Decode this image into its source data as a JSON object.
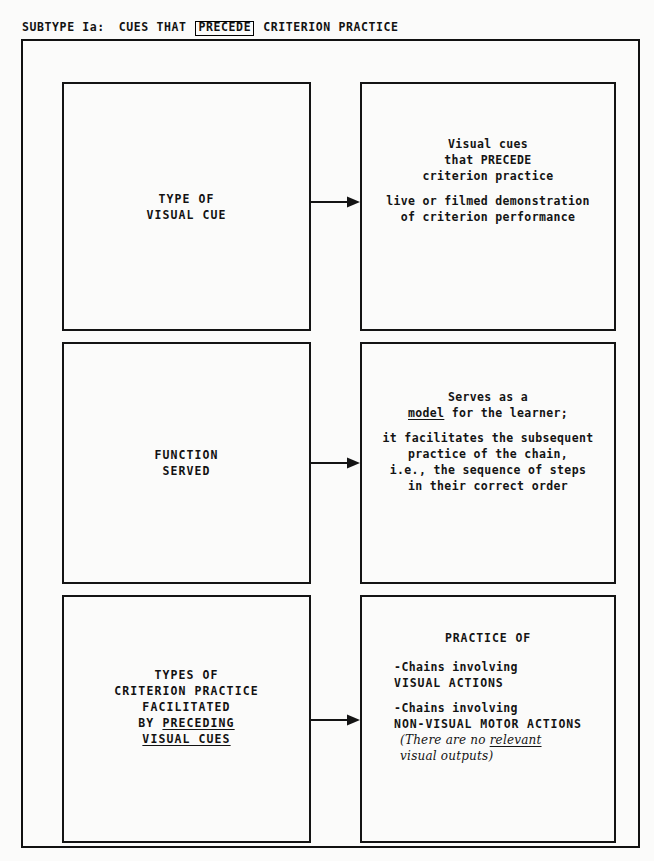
{
  "header": {
    "prefix": "SUBTYPE Ia:",
    "part1": "CUES THAT",
    "boxed_word": "PRECEDE",
    "part2": "CRITERION PRACTICE"
  },
  "rows": [
    {
      "id": "row-1",
      "left": {
        "lines": [
          "TYPE OF",
          "VISUAL CUE"
        ]
      },
      "right": {
        "group1": [
          "Visual cues",
          "that PRECEDE",
          "criterion practice"
        ],
        "group2": [
          "live or filmed demonstration",
          "of criterion performance"
        ]
      },
      "arrow": "arrow-type-of-visual-cue"
    },
    {
      "id": "row-2",
      "left": {
        "lines": [
          "FUNCTION",
          "SERVED"
        ]
      },
      "right": {
        "group1_a": "Serves as a",
        "group1_b_underlined": "model",
        "group1_b_rest": " for the learner;",
        "group2": [
          "it facilitates the subsequent",
          "practice of the chain,",
          "i.e., the sequence of steps",
          "in their correct order"
        ]
      },
      "arrow": "arrow-function-served"
    },
    {
      "id": "row-3",
      "left": {
        "lines": [
          "TYPES OF",
          "CRITERION PRACTICE",
          "FACILITATED"
        ],
        "line4_prefix": "BY ",
        "line4_underlined": "PRECEDING",
        "line5_underlined": "VISUAL CUES"
      },
      "right": {
        "title": "PRACTICE OF",
        "bullet1_a": "-Chains involving",
        "bullet1_b": " VISUAL ACTIONS",
        "bullet2_a": "-Chains involving",
        "bullet2_b": " NON-VISUAL MOTOR ACTIONS",
        "note_a_pre": "(There are no ",
        "note_a_underlined": "relevant",
        "note_b": " visual outputs)"
      },
      "arrow": "arrow-types-of-criterion-practice"
    }
  ],
  "colors": {
    "ink": "#121212",
    "paper": "#fbfbfa"
  }
}
